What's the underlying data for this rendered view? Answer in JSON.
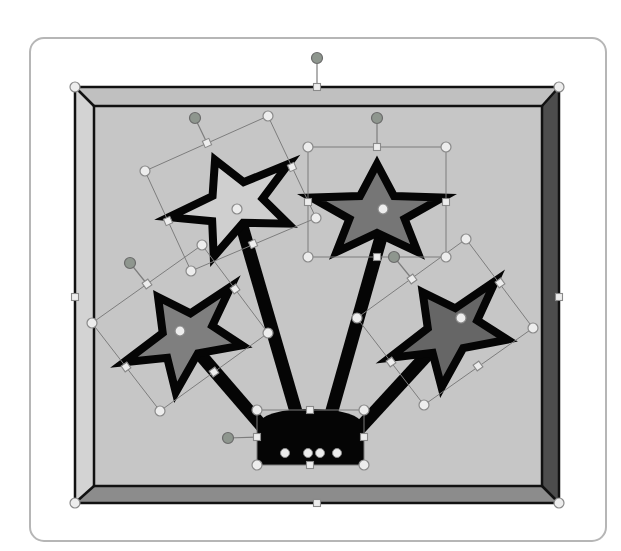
{
  "canvas": {
    "width": 621,
    "height": 551,
    "background": "#ffffff"
  },
  "colors": {
    "frame_stroke": "#b6b6b6",
    "panel": "#c6c6c6",
    "bevel_top": "#c0c0c0",
    "bevel_left": "#d3d3d3",
    "bevel_right": "#4d4d4d",
    "bevel_bottom": "#8c8c8c",
    "outline": "#111111",
    "shape_black": "#050505",
    "box_line": "#7d7d7d",
    "handle_fill": "#ededed",
    "handle_stroke": "#8a8a8a",
    "rotate_fill": "#8e968e",
    "rotate_stroke": "#6b6b6b"
  },
  "diagram": {
    "frame": {
      "x": 30,
      "y": 38,
      "width": 576,
      "height": 503,
      "radius": 14
    },
    "picture": {
      "outer": [
        75,
        87,
        559,
        503
      ],
      "inner": [
        94,
        106,
        542,
        486
      ]
    },
    "star_shape": {
      "points": [
        [
          0,
          -38
        ],
        [
          17,
          -5.9
        ],
        [
          65.5,
          -4.4
        ],
        [
          27.6,
          16.9
        ],
        [
          40.6,
          50
        ],
        [
          0,
          31
        ],
        [
          -40.6,
          50
        ],
        [
          -27.6,
          16.9
        ],
        [
          -65.5,
          -4.4
        ],
        [
          -17,
          -5.9
        ]
      ],
      "stroke_width": 8
    },
    "sticks": [
      {
        "name": "stick-1",
        "from": [
          237,
          209
        ],
        "to": [
          308,
          453
        ]
      },
      {
        "name": "stick-2",
        "from": [
          389,
          209
        ],
        "to": [
          320,
          453
        ]
      },
      {
        "name": "stick-3",
        "from": [
          180,
          331
        ],
        "to": [
          285,
          453
        ]
      },
      {
        "name": "stick-4",
        "from": [
          461,
          318
        ],
        "to": [
          337,
          453
        ]
      }
    ],
    "stick_width": 13,
    "base": {
      "path": "M257,465 V428 C257,414 283,409 310,409 C337,409 364,414 364,428 V465 Z",
      "endpoints": [
        [
          285,
          453
        ],
        [
          308,
          453
        ],
        [
          320,
          453
        ],
        [
          337,
          453
        ]
      ]
    },
    "stars": [
      {
        "name": "star-1",
        "center": [
          230.5,
          194.5
        ],
        "angle": -24,
        "fill": "#cfcfcf"
      },
      {
        "name": "star-2",
        "center": [
          377,
          202
        ],
        "angle": 0,
        "fill": "#767676"
      },
      {
        "name": "star-3",
        "center": [
          180,
          328
        ],
        "angle": -35.3,
        "fill": "#7f7f7f"
      },
      {
        "name": "star-4",
        "center": [
          445,
          323
        ],
        "angle": -36,
        "fill": "#666666"
      }
    ],
    "selections": [
      {
        "name": "picture-selection",
        "outline": false,
        "angle": 0,
        "corners": [
          [
            75,
            87
          ],
          [
            559,
            87
          ],
          [
            559,
            503
          ],
          [
            75,
            503
          ]
        ],
        "mids": [
          [
            317,
            87
          ],
          [
            559,
            297
          ],
          [
            317,
            503
          ],
          [
            75,
            297
          ]
        ],
        "rotate": {
          "handle": [
            317,
            58
          ],
          "anchor": [
            317,
            87
          ]
        },
        "adjust": null
      },
      {
        "name": "star-1-selection",
        "outline": true,
        "angle": -24,
        "corners": [
          [
            145,
            171
          ],
          [
            268,
            116
          ],
          [
            316,
            218
          ],
          [
            191,
            271
          ]
        ],
        "mids": [
          [
            207,
            143
          ],
          [
            292,
            167
          ],
          [
            253,
            244
          ],
          [
            168,
            221
          ]
        ],
        "rotate": {
          "handle": [
            195,
            118
          ],
          "anchor": [
            207,
            143
          ]
        },
        "adjust": [
          237,
          209
        ]
      },
      {
        "name": "star-2-selection",
        "outline": true,
        "angle": 0,
        "corners": [
          [
            308,
            147
          ],
          [
            446,
            147
          ],
          [
            446,
            257
          ],
          [
            308,
            257
          ]
        ],
        "mids": [
          [
            377,
            147
          ],
          [
            446,
            202
          ],
          [
            377,
            257
          ],
          [
            308,
            202
          ]
        ],
        "rotate": {
          "handle": [
            377,
            118
          ],
          "anchor": [
            377,
            147
          ]
        },
        "adjust": [
          383,
          209
        ]
      },
      {
        "name": "star-3-selection",
        "outline": true,
        "angle": -35.3,
        "corners": [
          [
            92,
            323
          ],
          [
            202,
            245
          ],
          [
            268,
            333
          ],
          [
            160,
            411
          ]
        ],
        "mids": [
          [
            147,
            284
          ],
          [
            235,
            289
          ],
          [
            214,
            372
          ],
          [
            126,
            367
          ]
        ],
        "rotate": {
          "handle": [
            130,
            263
          ],
          "anchor": [
            147,
            284
          ]
        },
        "adjust": [
          180,
          331
        ]
      },
      {
        "name": "star-4-selection",
        "outline": true,
        "angle": -36,
        "corners": [
          [
            357,
            318
          ],
          [
            466,
            239
          ],
          [
            533,
            328
          ],
          [
            424,
            405
          ]
        ],
        "mids": [
          [
            412,
            279
          ],
          [
            500,
            283
          ],
          [
            478,
            366
          ],
          [
            391,
            362
          ]
        ],
        "rotate": {
          "handle": [
            394,
            257
          ],
          "anchor": [
            412,
            279
          ]
        },
        "adjust": [
          461,
          318
        ]
      },
      {
        "name": "base-selection",
        "outline": true,
        "angle": 0,
        "corners": [
          [
            257,
            410
          ],
          [
            364,
            410
          ],
          [
            364,
            465
          ],
          [
            257,
            465
          ]
        ],
        "mids": [
          [
            310,
            410
          ],
          [
            364,
            437
          ],
          [
            310,
            465
          ],
          [
            257,
            437
          ]
        ],
        "rotate": {
          "handle": [
            228,
            438
          ],
          "anchor": [
            257,
            437
          ]
        },
        "adjust": null
      }
    ]
  }
}
